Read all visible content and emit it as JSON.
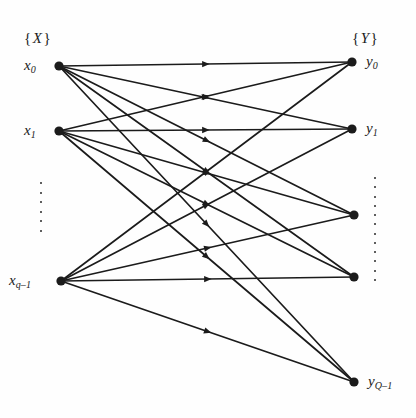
{
  "figure": {
    "background_color": "#fefefe",
    "ink_color": "#1b1b1b",
    "width": 416,
    "height": 418
  },
  "set_labels": {
    "left": {
      "open": "{",
      "symbol": "X",
      "close": "}",
      "x": 24,
      "y": 30
    },
    "right": {
      "open": "{",
      "symbol": "Y",
      "close": "}",
      "x": 352,
      "y": 30
    }
  },
  "left_nodes": [
    {
      "id": "x0",
      "base": "x",
      "sub": "0",
      "cx": 59,
      "cy": 66,
      "label_x": 24,
      "label_y": 57
    },
    {
      "id": "x1",
      "base": "x",
      "sub": "1",
      "cx": 59,
      "cy": 131,
      "label_x": 24,
      "label_y": 122
    },
    {
      "id": "xqm1",
      "base": "x",
      "sub": "q–1",
      "cx": 61,
      "cy": 281,
      "label_x": 9,
      "label_y": 272
    }
  ],
  "right_nodes": [
    {
      "id": "y0",
      "base": "y",
      "sub": "0",
      "cx": 352,
      "cy": 62,
      "label_x": 366,
      "label_y": 53
    },
    {
      "id": "y1",
      "base": "y",
      "sub": "1",
      "cx": 352,
      "cy": 129,
      "label_x": 366,
      "label_y": 120
    },
    {
      "id": "yA",
      "base": "",
      "sub": "",
      "cx": 354,
      "cy": 215,
      "label_x": 0,
      "label_y": 0
    },
    {
      "id": "yB",
      "base": "",
      "sub": "",
      "cx": 354,
      "cy": 277,
      "label_x": 0,
      "label_y": 0
    },
    {
      "id": "yQm1",
      "base": "y",
      "sub": "Q–1",
      "cx": 354,
      "cy": 382,
      "label_x": 368,
      "label_y": 373
    }
  ],
  "ellipses": [
    {
      "id": "left-vdots",
      "x": 40,
      "y": 182,
      "height": 50,
      "dots": 6
    },
    {
      "id": "right-vdots",
      "x": 374,
      "y": 177,
      "height": 104,
      "dots": 12
    }
  ],
  "edges": [
    {
      "from": "x0",
      "to": "y0",
      "x1": 59,
      "y1": 66,
      "x2": 352,
      "y2": 62
    },
    {
      "from": "x0",
      "to": "y1",
      "x1": 59,
      "y1": 66,
      "x2": 352,
      "y2": 129
    },
    {
      "from": "x0",
      "to": "yA",
      "x1": 59,
      "y1": 66,
      "x2": 354,
      "y2": 215
    },
    {
      "from": "x0",
      "to": "yB",
      "x1": 59,
      "y1": 66,
      "x2": 354,
      "y2": 277
    },
    {
      "from": "x0",
      "to": "yQm1",
      "x1": 59,
      "y1": 66,
      "x2": 354,
      "y2": 382
    },
    {
      "from": "x1",
      "to": "y0",
      "x1": 59,
      "y1": 131,
      "x2": 352,
      "y2": 62
    },
    {
      "from": "x1",
      "to": "y1",
      "x1": 59,
      "y1": 131,
      "x2": 352,
      "y2": 129
    },
    {
      "from": "x1",
      "to": "yA",
      "x1": 59,
      "y1": 131,
      "x2": 354,
      "y2": 215
    },
    {
      "from": "x1",
      "to": "yB",
      "x1": 59,
      "y1": 131,
      "x2": 354,
      "y2": 277
    },
    {
      "from": "x1",
      "to": "yQm1",
      "x1": 59,
      "y1": 131,
      "x2": 354,
      "y2": 382
    },
    {
      "from": "xqm1",
      "to": "y0",
      "x1": 61,
      "y1": 281,
      "x2": 352,
      "y2": 62
    },
    {
      "from": "xqm1",
      "to": "y1",
      "x1": 61,
      "y1": 281,
      "x2": 352,
      "y2": 129
    },
    {
      "from": "xqm1",
      "to": "yA",
      "x1": 61,
      "y1": 281,
      "x2": 354,
      "y2": 215
    },
    {
      "from": "xqm1",
      "to": "yB",
      "x1": 61,
      "y1": 281,
      "x2": 354,
      "y2": 277
    },
    {
      "from": "xqm1",
      "to": "yQm1",
      "x1": 61,
      "y1": 281,
      "x2": 354,
      "y2": 382
    }
  ],
  "style": {
    "node_radius": 4.6,
    "edge_width": 1.7,
    "arrow_size": 7.5,
    "arrow_position": 0.5
  }
}
